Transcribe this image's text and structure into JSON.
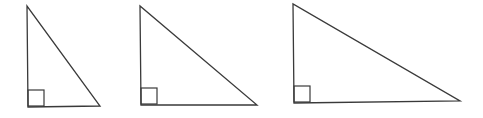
{
  "diagram": {
    "stroke_color": "#3a3a3a",
    "background": "#ffffff",
    "triangles": [
      {
        "id": "triangle-1",
        "vertices": {
          "top": [
            27,
            6
          ],
          "right_angle": [
            28,
            107
          ],
          "bottom_right": [
            100,
            106
          ]
        },
        "right_angle_marker": {
          "x": 28,
          "y": 90,
          "size": 16
        }
      },
      {
        "id": "triangle-2",
        "vertices": {
          "top": [
            140,
            6
          ],
          "right_angle": [
            141,
            105
          ],
          "bottom_right": [
            257,
            105
          ]
        },
        "right_angle_marker": {
          "x": 141,
          "y": 88,
          "size": 16
        }
      },
      {
        "id": "triangle-3",
        "vertices": {
          "top": [
            293,
            4
          ],
          "right_angle": [
            294,
            103
          ],
          "bottom_right": [
            460,
            101
          ]
        },
        "right_angle_marker": {
          "x": 294,
          "y": 86,
          "size": 16
        }
      }
    ]
  }
}
